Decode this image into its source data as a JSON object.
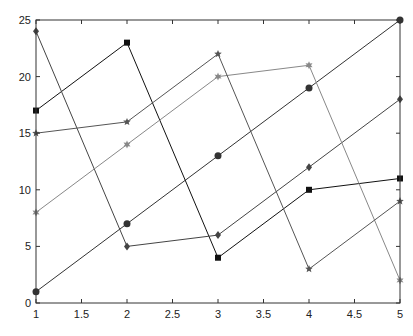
{
  "chart_data": {
    "type": "line",
    "title": "",
    "xlabel": "",
    "ylabel": "",
    "xlim": [
      1,
      5
    ],
    "ylim": [
      0,
      25
    ],
    "grid": false,
    "legend": null,
    "x_ticks": [
      "1",
      "1.5",
      "2",
      "2.5",
      "3",
      "3.5",
      "4",
      "4.5",
      "5"
    ],
    "y_ticks": [
      "0",
      "5",
      "10",
      "15",
      "20",
      "25"
    ],
    "x": [
      1,
      2,
      3,
      4,
      5
    ],
    "series": [
      {
        "name": "series-1",
        "marker": "circle",
        "color": "#333333",
        "values": [
          1,
          7,
          13,
          19,
          25
        ]
      },
      {
        "name": "series-2",
        "marker": "square",
        "color": "#111111",
        "values": [
          17,
          23,
          4,
          10,
          11
        ]
      },
      {
        "name": "series-3",
        "marker": "diamond",
        "color": "#444444",
        "values": [
          24,
          5,
          6,
          12,
          18
        ]
      },
      {
        "name": "series-4",
        "marker": "hexagram",
        "color": "#888888",
        "values": [
          8,
          14,
          20,
          21,
          2
        ]
      },
      {
        "name": "series-5",
        "marker": "pentagram",
        "color": "#555555",
        "values": [
          15,
          16,
          22,
          3,
          9
        ]
      }
    ]
  }
}
